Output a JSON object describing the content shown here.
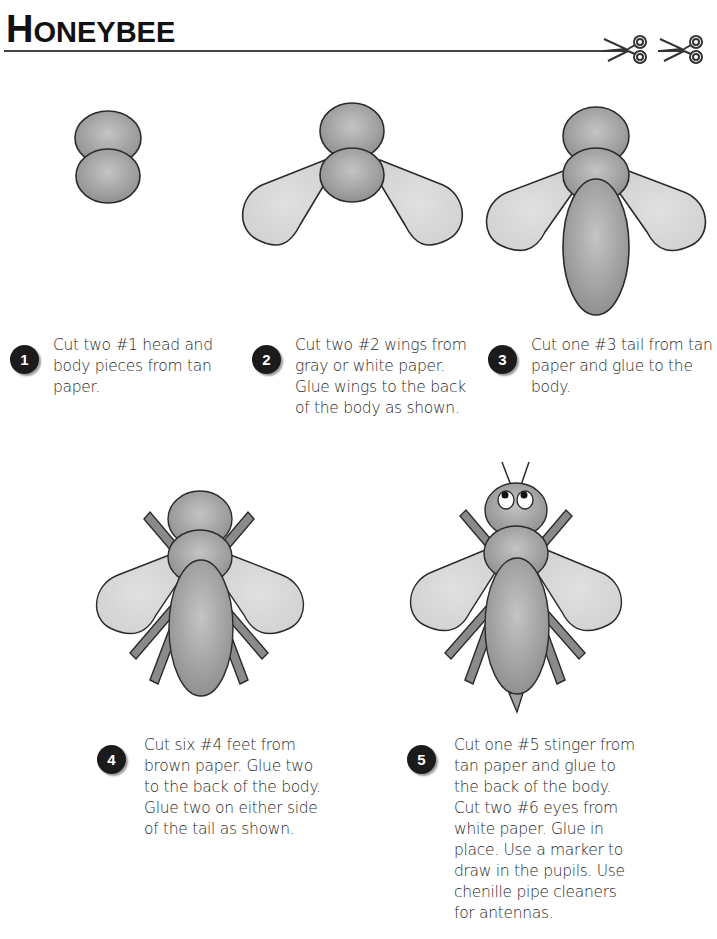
{
  "header": {
    "title": "Honeybee",
    "title_first": "H",
    "title_rest": "ONEYBEE",
    "icons": [
      "scissors-icon",
      "scissors-icon"
    ]
  },
  "colors": {
    "body_fill": "#a9a9a9",
    "wing_fill": "#d9d9d9",
    "leg_fill": "#8a8a8a",
    "outline": "#2b2b2b",
    "badge": "#1b1b1b"
  },
  "steps": [
    {
      "number": "1",
      "text": "Cut two #1 head and\nbody pieces from tan\npaper."
    },
    {
      "number": "2",
      "text": "Cut two #2 wings from\ngray or white paper.\nGlue wings to the back\nof the body as shown."
    },
    {
      "number": "3",
      "text": "Cut one #3 tail from tan\npaper and glue to the\nbody."
    },
    {
      "number": "4",
      "text": "Cut six #4 feet from\nbrown paper.  Glue two\nto the back of the body.\nGlue two on either side\nof the tail as shown."
    },
    {
      "number": "5",
      "text": "Cut one  #5 stinger from\ntan paper and glue to\nthe back of the body.\nCut two #6 eyes from\nwhite paper.  Glue in\nplace.  Use a marker to\ndraw in the pupils.  Use\nchenille pipe cleaners\nfor antennas."
    }
  ]
}
